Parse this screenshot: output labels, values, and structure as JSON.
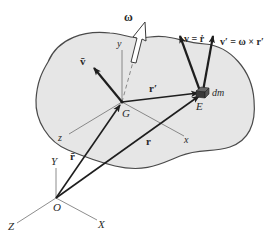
{
  "diagram": {
    "colors": {
      "body_fill": "#e6e6e6",
      "body_stroke": "#4a4a4a",
      "vector": "#1e1e1e",
      "axis": "#707070",
      "background": "#ffffff"
    },
    "points": {
      "G": "G",
      "E": "E",
      "O": "O"
    },
    "body_axes": {
      "x": "x",
      "y": "y",
      "z": "z"
    },
    "inertial_axes": {
      "X": "X",
      "Y": "Y",
      "Z": "Z"
    },
    "vectors": {
      "omega": "ω",
      "v_bar": "v̄",
      "v": "v = ṙ",
      "v_prime": "v′ = ω × r′",
      "r_prime": "r′",
      "r": "r",
      "r_bar": "r̄"
    },
    "mass_element": "dm"
  }
}
